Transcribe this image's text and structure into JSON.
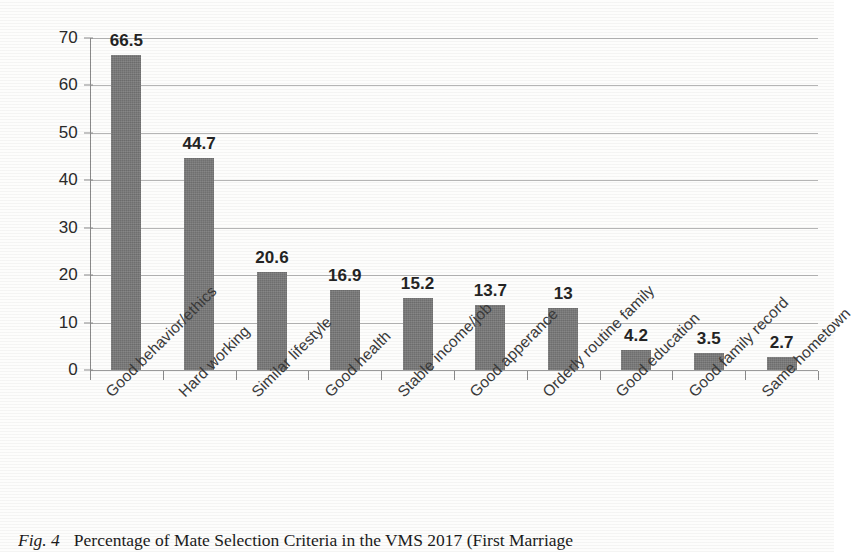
{
  "chart_data": {
    "type": "bar",
    "title": "",
    "subtitle": "",
    "xlabel": "",
    "ylabel": "",
    "ylim": [
      0,
      70
    ],
    "yticks": [
      0,
      10,
      20,
      30,
      40,
      50,
      60,
      70
    ],
    "grid": true,
    "legend": "none",
    "orientation": "vertical",
    "bar_color": "#787878",
    "categories": [
      "Good behavior/ethics",
      "Hard working",
      "Similar lifestyle",
      "Good health",
      "Stable income/job",
      "Good apperance",
      "Orderly routine family",
      "Good education",
      "Good family record",
      "Same hometown"
    ],
    "values": [
      66.5,
      44.7,
      20.6,
      16.9,
      15.2,
      13.7,
      13,
      4.2,
      3.5,
      2.7
    ],
    "value_labels": [
      "66.5",
      "44.7",
      "20.6",
      "16.9",
      "15.2",
      "13.7",
      "13",
      "4.2",
      "3.5",
      "2.7"
    ],
    "tick_labels": [
      "0",
      "10",
      "20",
      "30",
      "40",
      "50",
      "60",
      "70"
    ]
  },
  "caption": {
    "figure_number": "Fig. 4",
    "text": "Percentage of Mate Selection Criteria in the VMS 2017 (First Marriage"
  }
}
